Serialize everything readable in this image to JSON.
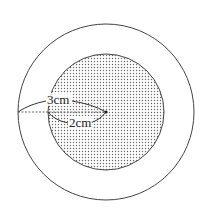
{
  "diagram": {
    "type": "concentric-circles",
    "outer_circle": {
      "radius_label": "3cm",
      "fill": "#ffffff",
      "stroke": "#444444"
    },
    "inner_circle": {
      "radius_label": "2cm",
      "fill_pattern": "dots",
      "stroke": "#444444"
    },
    "labels": {
      "outer_radius": "3cm",
      "inner_radius": "2cm"
    }
  }
}
